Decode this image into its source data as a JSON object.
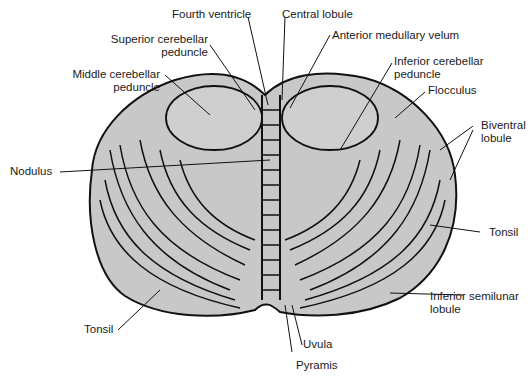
{
  "figure": {
    "colors": {
      "tissue_fill": "#c8c8c8",
      "outline": "#111111",
      "background": "#ffffff",
      "label_text": "#1a1a1a"
    },
    "labels": [
      {
        "id": "fourth-ventricle",
        "lines": [
          "Fourth ventricle"
        ]
      },
      {
        "id": "central-lobule",
        "lines": [
          "Central lobule"
        ]
      },
      {
        "id": "superior-cerebellar-peduncle",
        "lines": [
          "Superior cerebellar",
          "peduncle"
        ]
      },
      {
        "id": "anterior-medullary-velum",
        "lines": [
          "Anterior medullary velum"
        ]
      },
      {
        "id": "middle-cerebellar-peduncle",
        "lines": [
          "Middle cerebellar",
          "peduncle"
        ]
      },
      {
        "id": "inferior-cerebellar-peduncle",
        "lines": [
          "Inferior cerebellar",
          "peduncle"
        ]
      },
      {
        "id": "flocculus",
        "lines": [
          "Flocculus"
        ]
      },
      {
        "id": "biventral-lobule",
        "lines": [
          "Biventral",
          "lobule"
        ]
      },
      {
        "id": "nodulus",
        "lines": [
          "Nodulus"
        ]
      },
      {
        "id": "tonsil-right",
        "lines": [
          "Tonsil"
        ]
      },
      {
        "id": "inferior-semilunar-lobule",
        "lines": [
          "Inferior semilunar",
          "lobule"
        ]
      },
      {
        "id": "tonsil-left",
        "lines": [
          "Tonsil"
        ]
      },
      {
        "id": "uvula",
        "lines": [
          "Uvula"
        ]
      },
      {
        "id": "pyramis",
        "lines": [
          "Pyramis"
        ]
      }
    ]
  }
}
